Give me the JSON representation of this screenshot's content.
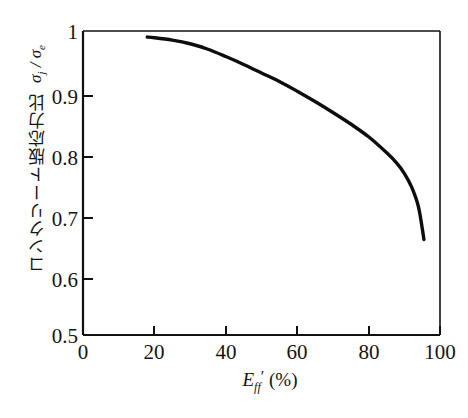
{
  "figure": {
    "background_color": "#ffffff",
    "axis_color": "#111111",
    "curve_color": "#0d0d0d"
  },
  "axes": {
    "x": {
      "label_parts": {
        "symbol": "E",
        "subscript": "ff",
        "prime": "′",
        "unit": "(%)"
      },
      "label_full": "E_ff′ (%)",
      "ticks": [
        "0",
        "20",
        "40",
        "60",
        "80",
        "100"
      ],
      "tick_values": [
        0,
        20,
        40,
        60,
        80,
        100
      ],
      "range": [
        0,
        100
      ]
    },
    "y": {
      "label_text": "コンクリート版応力比",
      "label_symbol_html": "σ<sub>j</sub> / σ<sub>e</sub>",
      "label_full": "コンクリート版応力比  σj / σe",
      "ticks": [
        "0.5",
        "0.6",
        "0.7",
        "0.8",
        "0.9",
        "1"
      ],
      "tick_values": [
        0.5,
        0.6,
        0.7,
        0.8,
        0.9,
        1.0
      ],
      "range": [
        0.5,
        1.0
      ]
    }
  },
  "chart_data": {
    "type": "line",
    "title": "",
    "xlabel": "E_ff′ (%)",
    "ylabel": "コンクリート版応力比 σj / σe",
    "xlim": [
      0,
      100
    ],
    "ylim": [
      0.5,
      1.0
    ],
    "xticks": [
      0,
      20,
      40,
      60,
      80,
      100
    ],
    "yticks": [
      0.5,
      0.6,
      0.7,
      0.8,
      0.9,
      1.0
    ],
    "grid": false,
    "legend": null,
    "series": [
      {
        "name": "stress ratio curve",
        "color": "#0d0d0d",
        "line_width": 3.4,
        "x": [
          18,
          20,
          25,
          30,
          35,
          40,
          45,
          50,
          55,
          60,
          65,
          70,
          75,
          80,
          85,
          88,
          90,
          92,
          94,
          95.5
        ],
        "y": [
          0.99,
          0.989,
          0.985,
          0.979,
          0.97,
          0.958,
          0.945,
          0.931,
          0.917,
          0.901,
          0.884,
          0.866,
          0.847,
          0.826,
          0.8,
          0.782,
          0.766,
          0.744,
          0.71,
          0.657
        ]
      }
    ]
  }
}
